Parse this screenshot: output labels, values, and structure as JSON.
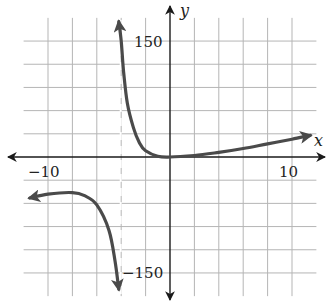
{
  "chart_data": {
    "type": "line",
    "title": "",
    "xlabel": "x",
    "ylabel": "y",
    "xlim": [
      -12,
      12
    ],
    "ylim": [
      -180,
      180
    ],
    "grid": true,
    "x_grid_step": 2,
    "y_grid_step": 30,
    "tick_labels": {
      "x": [
        {
          "value": -10,
          "label": "−10"
        },
        {
          "value": 10,
          "label": "10"
        }
      ],
      "y": [
        {
          "value": 150,
          "label": "150"
        },
        {
          "value": -150,
          "label": "−150"
        }
      ]
    },
    "vertical_asymptote": -4,
    "series": [
      {
        "name": "left branch",
        "points": [
          [
            -11.5,
            -53
          ],
          [
            -10,
            -48
          ],
          [
            -8,
            -46
          ],
          [
            -7,
            -50
          ],
          [
            -6,
            -62
          ],
          [
            -5,
            -95
          ],
          [
            -4.5,
            -135
          ],
          [
            -4.2,
            -171
          ]
        ],
        "arrows": [
          "start",
          "end"
        ]
      },
      {
        "name": "right branch",
        "points": [
          [
            -4.2,
            175
          ],
          [
            -4.0,
            150
          ],
          [
            -3.8,
            110
          ],
          [
            -3.5,
            70
          ],
          [
            -3,
            38
          ],
          [
            -2.5,
            18
          ],
          [
            -2,
            8
          ],
          [
            -1,
            1
          ],
          [
            0,
            0
          ],
          [
            2,
            2
          ],
          [
            4,
            6
          ],
          [
            6,
            11
          ],
          [
            8,
            17
          ],
          [
            10,
            23
          ],
          [
            11.5,
            28
          ]
        ],
        "arrows": [
          "start",
          "end"
        ]
      }
    ]
  },
  "labels": {
    "x_axis": "x",
    "y_axis": "y",
    "x_min_tick": "−10",
    "x_max_tick": "10",
    "y_max_tick": "150",
    "y_min_tick": "−150"
  },
  "colors": {
    "grid": "#b5b5b5",
    "axis": "#1a1a1a",
    "curve": "#4a4a4a"
  }
}
